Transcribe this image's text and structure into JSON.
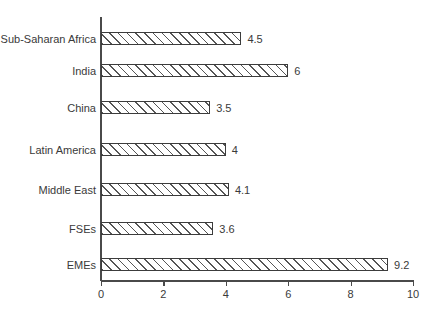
{
  "chart_data": {
    "type": "bar",
    "orientation": "horizontal",
    "title": "",
    "subtitle": "",
    "xlabel": "",
    "ylabel": "",
    "xlim": [
      0,
      10
    ],
    "xticks": [
      "0",
      "2",
      "4",
      "6",
      "8",
      "10"
    ],
    "grid": false,
    "legend": null,
    "categories": [
      "Sub-Saharan Africa",
      "India",
      "China",
      "Latin America",
      "Middle East",
      "FSEs",
      "EMEs"
    ],
    "values": [
      4.5,
      6,
      3.5,
      4,
      4.1,
      3.6,
      9.2
    ],
    "value_labels": [
      "4.5",
      "6",
      "3.5",
      "4",
      "4.1",
      "3.6",
      "9.2"
    ],
    "bar_fill": "#ffffff",
    "bar_hatch": "forward-diagonal",
    "bar_edge_color": "#3c3c3c",
    "axis_color": "#4a4a4a",
    "text_color": "#3a3a3a",
    "background": "#ffffff"
  }
}
